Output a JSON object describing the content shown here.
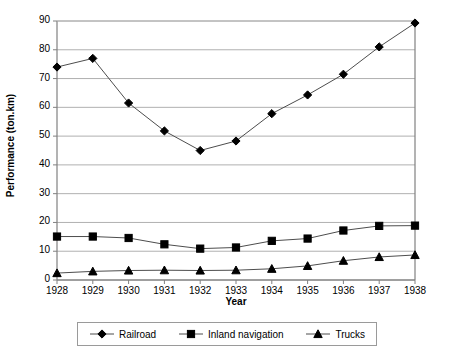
{
  "chart_data": {
    "type": "line",
    "title": "",
    "xlabel": "Year",
    "ylabel": "Performance (ton.km)",
    "categories": [
      "1928",
      "1929",
      "1930",
      "1931",
      "1932",
      "1933",
      "1934",
      "1935",
      "1936",
      "1937",
      "1938"
    ],
    "x": [
      1928,
      1929,
      1930,
      1931,
      1932,
      1933,
      1934,
      1935,
      1936,
      1937,
      1938
    ],
    "xlim": [
      1928,
      1938
    ],
    "ylim": [
      0,
      90
    ],
    "yticks": [
      0,
      10,
      20,
      30,
      40,
      50,
      60,
      70,
      80,
      90
    ],
    "ytick_labels": [
      "0",
      "10",
      "20",
      "30",
      "40",
      "50",
      "60",
      "70",
      "80",
      "90"
    ],
    "grid": "horizontal",
    "legend_position": "bottom",
    "series": [
      {
        "name": "Railroad",
        "marker": "diamond",
        "color": "#000000",
        "values": [
          74,
          77,
          61.5,
          51.8,
          45,
          48.3,
          57.8,
          64.3,
          71.5,
          81,
          89.3
        ]
      },
      {
        "name": "Inland navigation",
        "marker": "square",
        "color": "#000000",
        "values": [
          15.1,
          15.1,
          14.6,
          12.4,
          10.9,
          11.3,
          13.6,
          14.4,
          17.2,
          18.8,
          18.9
        ]
      },
      {
        "name": "Trucks",
        "marker": "triangle",
        "color": "#000000",
        "values": [
          2.4,
          3.0,
          3.3,
          3.4,
          3.3,
          3.4,
          3.9,
          4.9,
          6.7,
          8.0,
          8.7
        ]
      }
    ]
  },
  "axes": {
    "y_title": "Performance (ton.km)",
    "x_title": "Year"
  },
  "legend": {
    "items": [
      {
        "label": "Railroad",
        "marker": "diamond-marker-icon"
      },
      {
        "label": "Inland navigation",
        "marker": "square-marker-icon"
      },
      {
        "label": "Trucks",
        "marker": "triangle-marker-icon"
      }
    ]
  },
  "style": {
    "axis_color": "#808080",
    "grid_color": "#b0b0b0",
    "series_line_color": "#4d4d4d",
    "marker_color": "#000000",
    "background": "#ffffff"
  }
}
